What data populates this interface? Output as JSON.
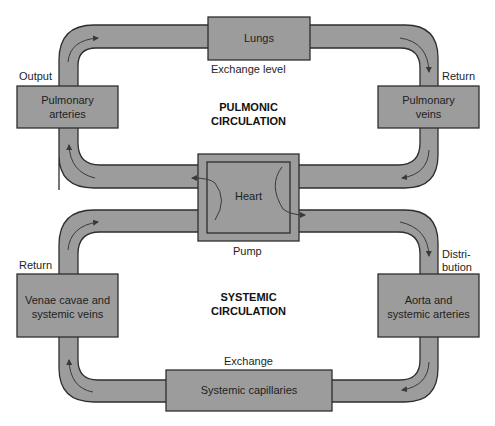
{
  "colors": {
    "background": "#ffffff",
    "fill": "#9c9c9c",
    "stroke": "#2e2e2e",
    "arrow": "#3a3a3a",
    "text": "#1e1e1e"
  },
  "pulmonic": {
    "title_line1": "PULMONIC",
    "title_line2": "CIRCULATION",
    "lungs": "Lungs",
    "exchange_label": "Exchange level",
    "arteries_line1": "Pulmonary",
    "arteries_line2": "arteries",
    "veins_line1": "Pulmonary",
    "veins_line2": "veins",
    "output_label": "Output",
    "return_label": "Return"
  },
  "heart": {
    "label": "Heart",
    "pump_label": "Pump"
  },
  "systemic": {
    "title_line1": "SYSTEMIC",
    "title_line2": "CIRCULATION",
    "venae_line1": "Venae cavae and",
    "venae_line2": "systemic veins",
    "aorta_line1": "Aorta and",
    "aorta_line2": "systemic arteries",
    "capillaries": "Systemic capillaries",
    "exchange_label": "Exchange",
    "return_label": "Return",
    "distribution_line1": "Distri-",
    "distribution_line2": "bution"
  }
}
